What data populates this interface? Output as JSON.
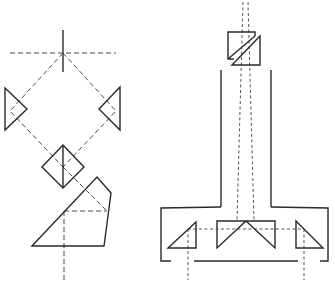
{
  "diagram": {
    "type": "optical-schematic",
    "colors": {
      "background": "#ffffff",
      "line": "#2a2a2a",
      "dashed": "#4a4a4a"
    },
    "left_assembly": {
      "crosshair": {
        "horizontal": [
          10,
          53,
          116,
          53
        ],
        "vertical": [
          63,
          30,
          63,
          72
        ]
      },
      "left_prism": [
        [
          5,
          88
        ],
        [
          27,
          109
        ],
        [
          5,
          130
        ]
      ],
      "right_prism": [
        [
          120,
          87
        ],
        [
          99,
          109
        ],
        [
          120,
          130
        ]
      ],
      "center_cube": [
        [
          63,
          145
        ],
        [
          84,
          167
        ],
        [
          63,
          188
        ],
        [
          42,
          167
        ]
      ],
      "pentaprism": [
        [
          32,
          246
        ],
        [
          97,
          177
        ],
        [
          111,
          193
        ],
        [
          104,
          246
        ]
      ],
      "beam_paths": [
        [
          [
            63,
            53
          ],
          [
            12,
            113
          ],
          [
            63,
            167
          ],
          [
            107,
            211
          ],
          [
            64,
            211
          ],
          [
            64,
            280
          ]
        ],
        [
          [
            63,
            53
          ],
          [
            113,
            113
          ],
          [
            63,
            167
          ]
        ]
      ]
    },
    "right_assembly": {
      "beamsplitter_cube": {
        "upper": [
          [
            228,
            32
          ],
          [
            255,
            32
          ],
          [
            255,
            36
          ],
          [
            228,
            59
          ],
          [
            228,
            32
          ]
        ],
        "lower": [
          [
            232,
            65
          ],
          [
            260,
            36
          ],
          [
            260,
            65
          ],
          [
            232,
            65
          ]
        ]
      },
      "tube_walls": {
        "left_x": 221,
        "right_x": 271,
        "top_y": 70,
        "bottom_y": 207
      },
      "base_housing": {
        "left_x": 161,
        "right_x": 328,
        "top_y": 208,
        "bottom_y": 261,
        "floor_segment": [
          194,
          298
        ]
      },
      "left_prism": [
        [
          196,
          222
        ],
        [
          168,
          248
        ],
        [
          196,
          248
        ]
      ],
      "center_roof_prism": {
        "box": [
          217,
          221,
          275,
          248
        ],
        "apex": [
          246,
          221
        ]
      },
      "right_prism": [
        [
          296,
          221
        ],
        [
          323,
          248
        ],
        [
          296,
          248
        ]
      ],
      "beam_paths": [
        [
          [
            243,
            5
          ],
          [
            237,
            221
          ]
        ],
        [
          [
            248,
            5
          ],
          [
            254,
            221
          ]
        ],
        [
          [
            188,
            229
          ],
          [
            304,
            229
          ]
        ],
        [
          [
            188,
            229
          ],
          [
            188,
            280
          ]
        ],
        [
          [
            304,
            229
          ],
          [
            304,
            280
          ]
        ]
      ]
    }
  }
}
